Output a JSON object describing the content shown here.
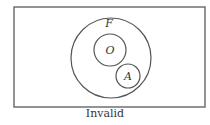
{
  "diagram": {
    "type": "euler",
    "universe": {
      "x": 14,
      "y": 7,
      "width": 191,
      "height": 100
    },
    "sets": [
      {
        "id": "F",
        "label": "F",
        "cx": 111,
        "cy": 58,
        "r": 40,
        "label_x": 109,
        "label_y": 27
      },
      {
        "id": "O",
        "label": "O",
        "cx": 110,
        "cy": 50,
        "r": 16,
        "label_x": 110,
        "label_y": 54
      },
      {
        "id": "A",
        "label": "A",
        "cx": 128,
        "cy": 76,
        "r": 12,
        "label_x": 128,
        "label_y": 80
      }
    ],
    "relations": [
      "O inside F",
      "A inside F",
      "O and A disjoint"
    ]
  },
  "caption": "Invalid"
}
